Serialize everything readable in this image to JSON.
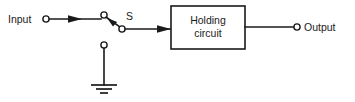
{
  "diagram": {
    "colors": {
      "background": "#ffffff",
      "line": "#1a1a1a",
      "text": "#1a1a1a"
    },
    "labels": {
      "input": "Input",
      "switch": "S",
      "output": "Output"
    },
    "block": {
      "line1": "Holding",
      "line2": "circuit"
    },
    "nodes": [
      {
        "name": "input-terminal",
        "type": "open-circle",
        "x": 46,
        "y": 19
      },
      {
        "name": "switch-pivot-terminal",
        "type": "open-circle",
        "x": 104,
        "y": 15
      },
      {
        "name": "switch-contact-terminal",
        "type": "open-circle",
        "x": 122,
        "y": 29
      },
      {
        "name": "ground-terminal",
        "type": "open-circle",
        "x": 104,
        "y": 45
      },
      {
        "name": "output-terminal",
        "type": "open-circle",
        "x": 297,
        "y": 27
      }
    ],
    "wires": [
      {
        "name": "input-wire",
        "from": "input-terminal",
        "to": "switch-pivot-terminal"
      },
      {
        "name": "switch-blade",
        "from": "switch-pivot-terminal",
        "to": "switch-contact-terminal"
      },
      {
        "name": "switch-to-block-wire",
        "from": "switch-contact-terminal",
        "to": "holding-circuit-block"
      },
      {
        "name": "block-to-output-wire",
        "from": "holding-circuit-block",
        "to": "output-terminal"
      },
      {
        "name": "ground-stem",
        "from": "ground-terminal",
        "to": "ground-symbol"
      }
    ],
    "arrows": [
      {
        "name": "input-flow-arrow",
        "direction": "right",
        "x": 78,
        "y": 19
      },
      {
        "name": "block-input-arrow",
        "direction": "right",
        "x": 169,
        "y": 29
      },
      {
        "name": "switch-pointer-arrow",
        "direction": "up-left",
        "x": 116,
        "y": 24
      }
    ],
    "ground": {
      "name": "ground-symbol",
      "bars": [
        {
          "width": 26,
          "y": 85
        },
        {
          "width": 16,
          "y": 89
        },
        {
          "width": 8,
          "y": 93
        }
      ]
    }
  }
}
